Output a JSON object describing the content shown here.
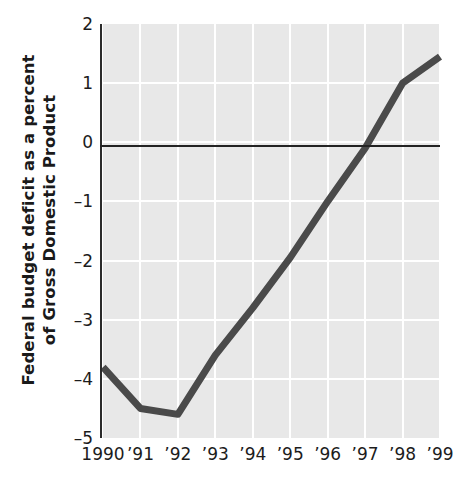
{
  "chart_data": {
    "type": "line",
    "title": "",
    "xlabel": "",
    "ylabel_line1": "Federal budget deficit as a percent",
    "ylabel_line2": "of Gross Domestic Product",
    "x": [
      1990,
      1991,
      1992,
      1993,
      1994,
      1995,
      1996,
      1997,
      1998,
      1999
    ],
    "categories": [
      "1990",
      "'91",
      "'92",
      "'93",
      "'94",
      "'95",
      "'96",
      "'97",
      "'98",
      "'99"
    ],
    "values": [
      -3.8,
      -4.5,
      -4.6,
      -3.6,
      -2.8,
      -1.95,
      -1.0,
      -0.1,
      1.0,
      1.45
    ],
    "ytick_labels": [
      "2",
      "1",
      "0",
      "-1",
      "-2",
      "-3",
      "-4",
      "-5"
    ],
    "ytick_values": [
      2,
      1,
      0,
      -1,
      -2,
      -3,
      -4,
      -5
    ],
    "ylim": [
      -5,
      2
    ],
    "xlim": [
      1990,
      1999
    ],
    "grid": true,
    "gridlines": "white vertical and horizontal gridlines on light gray panel",
    "legend": "none",
    "zero_reference_line": 0,
    "series_color": "#4a4a4a",
    "panel_color": "#e8e8e8",
    "axis_color": "#2b2b2b",
    "grid_color": "#ffffff"
  }
}
